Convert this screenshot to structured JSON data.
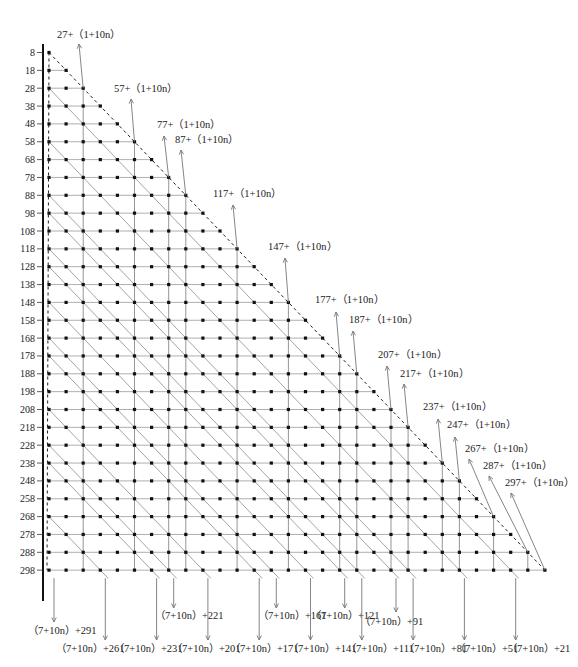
{
  "diagram": {
    "rows": {
      "count": 30,
      "start_value": 8,
      "step": 10,
      "labels": [
        "8",
        "18",
        "28",
        "38",
        "48",
        "58",
        "68",
        "78",
        "88",
        "98",
        "108",
        "118",
        "128",
        "138",
        "148",
        "158",
        "168",
        "178",
        "188",
        "198",
        "208",
        "218",
        "228",
        "238",
        "248",
        "258",
        "268",
        "278",
        "288",
        "298"
      ]
    },
    "layout": {
      "x0": 49,
      "dx": 17.1,
      "y0": 52.5,
      "dy": 17.85,
      "axis_x": 43,
      "axis_top": 44,
      "axis_bottom": 601
    },
    "top_annotations": [
      {
        "col": 2,
        "text": "27+（1+10n）",
        "label_x": 57,
        "label_y": 38,
        "tip_x": 79,
        "tip_y": 44
      },
      {
        "col": 5,
        "text": "57+（1+10n）",
        "label_x": 114,
        "label_y": 92,
        "tip_x": 131,
        "tip_y": 99
      },
      {
        "col": 7,
        "text": "77+（1+10n）",
        "label_x": 157,
        "label_y": 128,
        "tip_x": 164,
        "tip_y": 136
      },
      {
        "col": 8,
        "text": "87+（1+10n）",
        "label_x": 175,
        "label_y": 143,
        "tip_x": 181,
        "tip_y": 150
      },
      {
        "col": 11,
        "text": "117+（1+10n）",
        "label_x": 213,
        "label_y": 197,
        "tip_x": 233,
        "tip_y": 205
      },
      {
        "col": 14,
        "text": "147+（1+10n）",
        "label_x": 268,
        "label_y": 250,
        "tip_x": 285,
        "tip_y": 258
      },
      {
        "col": 17,
        "text": "177+（1+10n）",
        "label_x": 315,
        "label_y": 303,
        "tip_x": 336,
        "tip_y": 312
      },
      {
        "col": 18,
        "text": "187+（1+10n）",
        "label_x": 349,
        "label_y": 323,
        "tip_x": 353,
        "tip_y": 331
      },
      {
        "col": 20,
        "text": "207+（1+10n）",
        "label_x": 378,
        "label_y": 358,
        "tip_x": 387,
        "tip_y": 366
      },
      {
        "col": 21,
        "text": "217+（1+10n）",
        "label_x": 400,
        "label_y": 377,
        "tip_x": 404,
        "tip_y": 384
      },
      {
        "col": 23,
        "text": "237+（1+10n）",
        "label_x": 423,
        "label_y": 410,
        "tip_x": 438,
        "tip_y": 419
      },
      {
        "col": 24,
        "text": "247+（1+10n）",
        "label_x": 447,
        "label_y": 428,
        "tip_x": 455,
        "tip_y": 437
      },
      {
        "col": 26,
        "text": "267+（1+10n）",
        "label_x": 465,
        "label_y": 452,
        "tip_x": 469,
        "tip_y": 459
      },
      {
        "col": 28,
        "text": "287+（1+10n）",
        "label_x": 483,
        "label_y": 469,
        "tip_x": 489,
        "tip_y": 476
      },
      {
        "col": 29,
        "text": "297+（1+10n）",
        "label_x": 505,
        "label_y": 486,
        "tip_x": 511,
        "tip_y": 493
      }
    ],
    "bottom_annotations": [
      {
        "start_row": 29,
        "col": 0,
        "text": "（7+10n）+291",
        "arrow_end_y": 622,
        "label_x": 28,
        "label_y": 634
      },
      {
        "start_row": 26,
        "col": 3,
        "text": "（7+10n）+261",
        "arrow_end_y": 640,
        "label_x": 56,
        "label_y": 652
      },
      {
        "start_row": 23,
        "col": 6,
        "text": "（7+10n）+231",
        "arrow_end_y": 640,
        "label_x": 114,
        "label_y": 652
      },
      {
        "start_row": 22,
        "col": 7,
        "text": "（7+10n）+221",
        "arrow_end_y": 608,
        "label_x": 155,
        "label_y": 619
      },
      {
        "start_row": 20,
        "col": 9,
        "text": "（7+10n）+201",
        "arrow_end_y": 640,
        "label_x": 172,
        "label_y": 652
      },
      {
        "start_row": 17,
        "col": 12,
        "text": "（7+10n）+171",
        "arrow_end_y": 640,
        "label_x": 230,
        "label_y": 652
      },
      {
        "start_row": 16,
        "col": 13,
        "text": "（7+10n）+161",
        "arrow_end_y": 608,
        "label_x": 258,
        "label_y": 619
      },
      {
        "start_row": 14,
        "col": 15,
        "text": "（7+10n）+141",
        "arrow_end_y": 640,
        "label_x": 288,
        "label_y": 652
      },
      {
        "start_row": 12,
        "col": 17,
        "text": "（7+10n）+121",
        "arrow_end_y": 608,
        "label_x": 311,
        "label_y": 619
      },
      {
        "start_row": 11,
        "col": 18,
        "text": "（7+10n）+111",
        "arrow_end_y": 640,
        "label_x": 346,
        "label_y": 652
      },
      {
        "start_row": 9,
        "col": 20,
        "text": "（7+10n）+91",
        "arrow_end_y": 612,
        "label_x": 360,
        "label_y": 625
      },
      {
        "start_row": 8,
        "col": 21,
        "text": "（7+10n）+81",
        "arrow_end_y": 640,
        "label_x": 404,
        "label_y": 652
      },
      {
        "start_row": 5,
        "col": 24,
        "text": "（7+10n）+51",
        "arrow_end_y": 640,
        "label_x": 455,
        "label_y": 652
      },
      {
        "start_row": 2,
        "col": 27,
        "text": "（7+10n）+21",
        "arrow_end_y": 640,
        "label_x": 507,
        "label_y": 652
      }
    ]
  }
}
